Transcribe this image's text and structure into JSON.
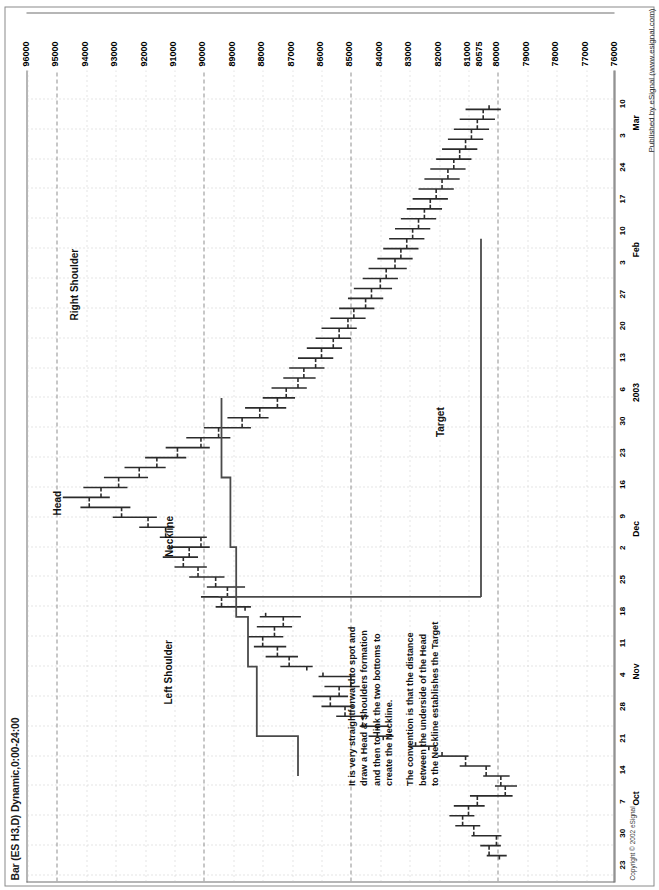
{
  "window": {
    "title": "Bar (ES H3,D) Dynamic,0:00-24:00",
    "copyright": "Copyright © 2002 eSignal",
    "published": "Published by eSignal (www.esignal.com)"
  },
  "annotations": {
    "left_shoulder": "Left Shoulder",
    "head": "Head",
    "right_shoulder": "Right Shoulder",
    "neckline": "Neckline",
    "target": "Target",
    "note1": "It is very straightforward to spot and\ndraw a Head & Shoulders formation\nand then to link the two bottoms to\ncreate the Neckline.",
    "note2": "The convention is that the distance\nbetween the underside of the Head\nto the Neckline establishes the Target"
  },
  "colors": {
    "bar": "#2b2b2b",
    "grid_dot": "#c9c9c9",
    "grid_dash": "#8f8f8f",
    "frame": "#6e6e6e",
    "text": "#111111",
    "overlay": "#4a4a4a"
  },
  "chart_data": {
    "type": "bar",
    "subtype": "ohlc-bar",
    "title": "Bar (ES H3,D) Dynamic,0:00-24:00",
    "xlabel": "",
    "ylabel": "",
    "ylim": [
      76000,
      96000
    ],
    "ytick_step": 1000,
    "grid": true,
    "legend": false,
    "ytick_labels": [
      "96000",
      "95000",
      "94000",
      "93000",
      "92000",
      "91000",
      "90000",
      "89000",
      "88000",
      "87000",
      "86000",
      "85000",
      "84000",
      "83000",
      "82000",
      "81000",
      "80575",
      "80000",
      "79000",
      "78000",
      "77000",
      "76000"
    ],
    "ymarker": 80575,
    "xtick_labels": [
      "23",
      "30",
      "Oct",
      "7",
      "14",
      "21",
      "28",
      "Nov",
      "4",
      "11",
      "18",
      "25",
      "2",
      "Dec",
      "9",
      "16",
      "23",
      "30",
      "2003",
      "6",
      "13",
      "20",
      "27",
      "3",
      "Feb",
      "10",
      "17",
      "24",
      "3",
      "Mar",
      "10"
    ],
    "x_day_ticks": [
      "23",
      "30",
      "7",
      "14",
      "21",
      "28",
      "4",
      "11",
      "18",
      "25",
      "2",
      "9",
      "16",
      "23",
      "30",
      "6",
      "13",
      "20",
      "27",
      "3",
      "10",
      "17",
      "24",
      "3",
      "10"
    ],
    "x_month_ticks": [
      "Oct",
      "Nov",
      "Dec",
      "2003",
      "Feb",
      "Mar"
    ],
    "overlays": [
      {
        "name": "neckline",
        "label": "Neckline",
        "type": "stepped-line"
      },
      {
        "name": "target",
        "label": "Target",
        "type": "vertical-line",
        "value": 80575
      }
    ],
    "pattern": "Head and Shoulders",
    "bars": [
      {
        "i": 0,
        "o": 79950,
        "h": 80380,
        "l": 79700,
        "c": 80300
      },
      {
        "i": 1,
        "o": 80300,
        "h": 80600,
        "l": 79900,
        "c": 80050
      },
      {
        "i": 2,
        "o": 80050,
        "h": 80900,
        "l": 79880,
        "c": 80820
      },
      {
        "i": 3,
        "o": 80820,
        "h": 81450,
        "l": 80600,
        "c": 81200
      },
      {
        "i": 4,
        "o": 81200,
        "h": 81650,
        "l": 80800,
        "c": 81000
      },
      {
        "i": 5,
        "o": 81000,
        "h": 81500,
        "l": 80450,
        "c": 80700
      },
      {
        "i": 6,
        "o": 80700,
        "h": 80950,
        "l": 79500,
        "c": 79750
      },
      {
        "i": 7,
        "o": 79750,
        "h": 80100,
        "l": 79350,
        "c": 79900
      },
      {
        "i": 8,
        "o": 79900,
        "h": 80500,
        "l": 79600,
        "c": 80400
      },
      {
        "i": 9,
        "o": 80400,
        "h": 81300,
        "l": 80250,
        "c": 81100
      },
      {
        "i": 10,
        "o": 81100,
        "h": 82050,
        "l": 81000,
        "c": 81900
      },
      {
        "i": 11,
        "o": 82350,
        "h": 83050,
        "l": 82100,
        "c": 82800
      },
      {
        "i": 12,
        "o": 83900,
        "h": 84400,
        "l": 83550,
        "c": 84100
      },
      {
        "i": 13,
        "o": 84100,
        "h": 84700,
        "l": 83700,
        "c": 84600
      },
      {
        "i": 14,
        "o": 84600,
        "h": 85500,
        "l": 84400,
        "c": 85200
      },
      {
        "i": 15,
        "o": 85200,
        "h": 86000,
        "l": 84900,
        "c": 85700
      },
      {
        "i": 16,
        "o": 85700,
        "h": 86300,
        "l": 85100,
        "c": 85400
      },
      {
        "i": 17,
        "o": 85400,
        "h": 85900,
        "l": 84700,
        "c": 85000
      },
      {
        "i": 18,
        "o": 85000,
        "h": 86100,
        "l": 84850,
        "c": 85950
      },
      {
        "i": 19,
        "o": 86500,
        "h": 87400,
        "l": 86300,
        "c": 87100
      },
      {
        "i": 20,
        "o": 87100,
        "h": 87900,
        "l": 86800,
        "c": 87500
      },
      {
        "i": 21,
        "o": 87500,
        "h": 88300,
        "l": 87200,
        "c": 88000
      },
      {
        "i": 22,
        "o": 88000,
        "h": 88500,
        "l": 87300,
        "c": 87600
      },
      {
        "i": 23,
        "o": 87600,
        "h": 88200,
        "l": 87000,
        "c": 87300
      },
      {
        "i": 24,
        "o": 87300,
        "h": 88100,
        "l": 86700,
        "c": 87900
      },
      {
        "i": 25,
        "o": 88600,
        "h": 89600,
        "l": 88400,
        "c": 89400
      },
      {
        "i": 26,
        "o": 89400,
        "h": 90100,
        "l": 88900,
        "c": 89200
      },
      {
        "i": 27,
        "o": 89200,
        "h": 89900,
        "l": 88600,
        "c": 89600
      },
      {
        "i": 28,
        "o": 89600,
        "h": 90500,
        "l": 89300,
        "c": 90200
      },
      {
        "i": 29,
        "o": 90200,
        "h": 91000,
        "l": 89900,
        "c": 90700
      },
      {
        "i": 30,
        "o": 90700,
        "h": 91400,
        "l": 90200,
        "c": 90500
      },
      {
        "i": 31,
        "o": 90500,
        "h": 91200,
        "l": 89800,
        "c": 90100
      },
      {
        "i": 32,
        "o": 90100,
        "h": 91500,
        "l": 89900,
        "c": 91300
      },
      {
        "i": 33,
        "o": 91300,
        "h": 92200,
        "l": 91000,
        "c": 91900
      },
      {
        "i": 34,
        "o": 91900,
        "h": 93100,
        "l": 91600,
        "c": 92800
      },
      {
        "i": 35,
        "o": 92800,
        "h": 94200,
        "l": 92500,
        "c": 93900
      },
      {
        "i": 36,
        "o": 93900,
        "h": 94800,
        "l": 93200,
        "c": 93500
      },
      {
        "i": 37,
        "o": 93500,
        "h": 94100,
        "l": 92600,
        "c": 92900
      },
      {
        "i": 38,
        "o": 92900,
        "h": 93400,
        "l": 91900,
        "c": 92200
      },
      {
        "i": 39,
        "o": 92200,
        "h": 92700,
        "l": 91300,
        "c": 91600
      },
      {
        "i": 40,
        "o": 91600,
        "h": 92000,
        "l": 90600,
        "c": 90900
      },
      {
        "i": 41,
        "o": 90900,
        "h": 91300,
        "l": 89800,
        "c": 90100
      },
      {
        "i": 42,
        "o": 90100,
        "h": 90600,
        "l": 89100,
        "c": 89500
      },
      {
        "i": 43,
        "o": 89500,
        "h": 90000,
        "l": 88400,
        "c": 88700
      },
      {
        "i": 44,
        "o": 88700,
        "h": 89200,
        "l": 87800,
        "c": 88100
      },
      {
        "i": 45,
        "o": 88100,
        "h": 88600,
        "l": 87200,
        "c": 87500
      },
      {
        "i": 46,
        "o": 87500,
        "h": 88000,
        "l": 86900,
        "c": 87200
      },
      {
        "i": 47,
        "o": 87200,
        "h": 87700,
        "l": 86500,
        "c": 86800
      },
      {
        "i": 48,
        "o": 86800,
        "h": 87300,
        "l": 86200,
        "c": 86600
      },
      {
        "i": 49,
        "o": 86600,
        "h": 87100,
        "l": 85900,
        "c": 86200
      },
      {
        "i": 50,
        "o": 86200,
        "h": 86800,
        "l": 85600,
        "c": 86000
      },
      {
        "i": 51,
        "o": 86000,
        "h": 86500,
        "l": 85300,
        "c": 85600
      },
      {
        "i": 52,
        "o": 85600,
        "h": 86200,
        "l": 85000,
        "c": 85400
      },
      {
        "i": 53,
        "o": 85400,
        "h": 86000,
        "l": 84800,
        "c": 85100
      },
      {
        "i": 54,
        "o": 85100,
        "h": 85700,
        "l": 84500,
        "c": 84900
      },
      {
        "i": 55,
        "o": 84900,
        "h": 85400,
        "l": 84200,
        "c": 84500
      },
      {
        "i": 56,
        "o": 84500,
        "h": 85100,
        "l": 83900,
        "c": 84300
      },
      {
        "i": 57,
        "o": 84300,
        "h": 84900,
        "l": 83600,
        "c": 84000
      },
      {
        "i": 58,
        "o": 84000,
        "h": 84600,
        "l": 83400,
        "c": 83800
      },
      {
        "i": 59,
        "o": 83800,
        "h": 84400,
        "l": 83100,
        "c": 83500
      },
      {
        "i": 60,
        "o": 83500,
        "h": 84100,
        "l": 82900,
        "c": 83300
      },
      {
        "i": 61,
        "o": 83300,
        "h": 83900,
        "l": 82700,
        "c": 83100
      },
      {
        "i": 62,
        "o": 83100,
        "h": 83700,
        "l": 82500,
        "c": 82900
      },
      {
        "i": 63,
        "o": 82900,
        "h": 83500,
        "l": 82300,
        "c": 82700
      },
      {
        "i": 64,
        "o": 82700,
        "h": 83300,
        "l": 82100,
        "c": 82500
      },
      {
        "i": 65,
        "o": 82500,
        "h": 83100,
        "l": 81900,
        "c": 82300
      },
      {
        "i": 66,
        "o": 82300,
        "h": 82900,
        "l": 81700,
        "c": 82100
      },
      {
        "i": 67,
        "o": 82100,
        "h": 82700,
        "l": 81500,
        "c": 81900
      },
      {
        "i": 68,
        "o": 81900,
        "h": 82500,
        "l": 81300,
        "c": 81700
      },
      {
        "i": 69,
        "o": 81700,
        "h": 82300,
        "l": 81100,
        "c": 81500
      },
      {
        "i": 70,
        "o": 81500,
        "h": 82100,
        "l": 80900,
        "c": 81300
      },
      {
        "i": 71,
        "o": 81300,
        "h": 81900,
        "l": 80700,
        "c": 81100
      },
      {
        "i": 72,
        "o": 81100,
        "h": 81700,
        "l": 80500,
        "c": 80900
      },
      {
        "i": 73,
        "o": 80900,
        "h": 81500,
        "l": 80300,
        "c": 80700
      },
      {
        "i": 74,
        "o": 80700,
        "h": 81300,
        "l": 80100,
        "c": 80500
      },
      {
        "i": 75,
        "o": 80500,
        "h": 81100,
        "l": 79900,
        "c": 80300
      }
    ]
  }
}
